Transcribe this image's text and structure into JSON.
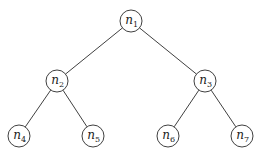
{
  "diagram": {
    "type": "binary-tree",
    "node_radius": 11,
    "colors": {
      "stroke": "#2a2a2a",
      "fill": "#ffffff",
      "text": "#1a1a1a"
    },
    "nodes": [
      {
        "id": "n1",
        "base": "n",
        "sub": "1",
        "x": 131,
        "y": 21
      },
      {
        "id": "n2",
        "base": "n",
        "sub": "2",
        "x": 57,
        "y": 81
      },
      {
        "id": "n3",
        "base": "n",
        "sub": "3",
        "x": 205,
        "y": 81
      },
      {
        "id": "n4",
        "base": "n",
        "sub": "4",
        "x": 19,
        "y": 136
      },
      {
        "id": "n5",
        "base": "n",
        "sub": "5",
        "x": 93,
        "y": 136
      },
      {
        "id": "n6",
        "base": "n",
        "sub": "6",
        "x": 168,
        "y": 136
      },
      {
        "id": "n7",
        "base": "n",
        "sub": "7",
        "x": 242,
        "y": 136
      }
    ],
    "edges": [
      {
        "from": "n1",
        "to": "n2"
      },
      {
        "from": "n1",
        "to": "n3"
      },
      {
        "from": "n2",
        "to": "n4"
      },
      {
        "from": "n2",
        "to": "n5"
      },
      {
        "from": "n3",
        "to": "n6"
      },
      {
        "from": "n3",
        "to": "n7"
      }
    ]
  }
}
